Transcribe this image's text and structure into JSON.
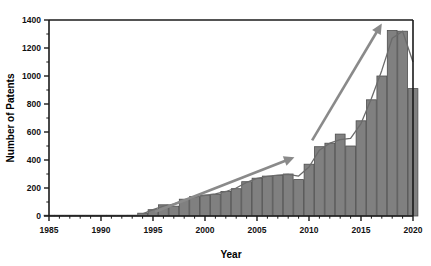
{
  "chart_data": {
    "type": "bar",
    "title": "",
    "xlabel": "Year",
    "ylabel": "Number of Patents",
    "xlim": [
      1985,
      2020
    ],
    "ylim": [
      0,
      1400
    ],
    "grid": false,
    "legend": "none",
    "xticks": [
      1985,
      1990,
      1995,
      2000,
      2005,
      2010,
      2015,
      2020
    ],
    "yticks": [
      0,
      200,
      400,
      600,
      800,
      1000,
      1200,
      1400
    ],
    "xtick_labels": [
      "1985",
      "1990",
      "1995",
      "2000",
      "2005",
      "2010",
      "2015",
      "2020"
    ],
    "ytick_labels": [
      "0",
      "200",
      "400",
      "600",
      "800",
      "1000",
      "1200",
      "1400"
    ],
    "x_minor_tick_step": 1,
    "y_minor_tick_step": 100,
    "bar_fill_color": "#808080",
    "bar_edge_color": "#4d4d4d",
    "trend_line_color": "#6b6b6b",
    "arrow_color": "#8a8a8a",
    "axis_color": "#1a1a1a",
    "categories": [
      1985,
      1986,
      1987,
      1988,
      1989,
      1990,
      1991,
      1992,
      1993,
      1994,
      1995,
      1996,
      1997,
      1998,
      1999,
      2000,
      2001,
      2002,
      2003,
      2004,
      2005,
      2006,
      2007,
      2008,
      2009,
      2010,
      2011,
      2012,
      2013,
      2014,
      2015,
      2016,
      2017,
      2018,
      2019,
      2020
    ],
    "values": [
      3,
      2,
      2,
      3,
      4,
      4,
      5,
      5,
      6,
      20,
      45,
      80,
      70,
      120,
      140,
      150,
      155,
      175,
      195,
      245,
      270,
      285,
      290,
      300,
      260,
      370,
      495,
      520,
      585,
      500,
      680,
      830,
      1000,
      1325,
      1320,
      910
    ],
    "annotations": [
      {
        "name": "slow-growth-arrow",
        "type": "arrow",
        "x_start": 1995.2,
        "y_start": 30,
        "x_end": 2008.6,
        "y_end": 420,
        "label": ""
      },
      {
        "name": "rapid-growth-arrow",
        "type": "arrow",
        "x_start": 2010.3,
        "y_start": 540,
        "x_end": 2017.0,
        "y_end": 1375,
        "label": ""
      }
    ],
    "trend_curve": {
      "name": "smoothed-trend",
      "x": [
        1994,
        1995,
        1996,
        1997,
        1998,
        1999,
        2000,
        2001,
        2002,
        2003,
        2004,
        2005,
        2006,
        2007,
        2008,
        2009,
        2010,
        2011,
        2012,
        2013,
        2014,
        2015,
        2016,
        2017,
        2018,
        2019,
        2020
      ],
      "y": [
        15,
        45,
        70,
        85,
        115,
        135,
        148,
        158,
        175,
        200,
        240,
        268,
        283,
        292,
        297,
        285,
        350,
        470,
        520,
        545,
        555,
        660,
        840,
        1040,
        1270,
        1320,
        1100
      ]
    }
  },
  "axis": {
    "ylabel": "Number of Patents",
    "xlabel": "Year"
  }
}
